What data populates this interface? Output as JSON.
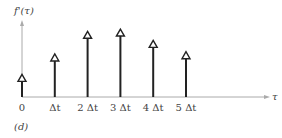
{
  "chart_data": {
    "type": "stem",
    "title": "",
    "ylabel": "f'(τ)",
    "xlabel": "τ",
    "panel_label": "(d)",
    "categories": [
      "0",
      "Δt",
      "2 Δt",
      "3 Δt",
      "4 Δt",
      "5 Δt"
    ],
    "x": [
      0,
      1,
      2,
      3,
      4,
      5
    ],
    "values": [
      1.0,
      1.9,
      2.9,
      3.0,
      2.5,
      2.0
    ],
    "ylim": [
      0,
      3.4
    ],
    "grid": false,
    "legend": null,
    "marker": "open-triangle-arrow"
  },
  "labels": {
    "ylabel": "f'(τ)",
    "xlabel": "τ",
    "panel": "(d)",
    "ticks": [
      "0",
      "Δt",
      "2 Δt",
      "3 Δt",
      "4 Δt",
      "5 Δt"
    ]
  },
  "colors": {
    "stem": "#222222",
    "axis": "#999999",
    "text": "#444444"
  }
}
